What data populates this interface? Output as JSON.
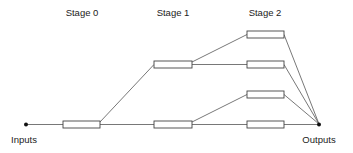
{
  "diagram": {
    "type": "staged-tree-network",
    "stages": [
      {
        "label": "Stage 0",
        "label_x": 82
      },
      {
        "label": "Stage 1",
        "label_x": 173
      },
      {
        "label": "Stage 2",
        "label_x": 265
      }
    ],
    "terminals": {
      "inputs": {
        "label": "Inputs",
        "x": 26,
        "y": 124
      },
      "outputs": {
        "label": "Outputs",
        "x": 319,
        "y": 124
      }
    },
    "colors": {
      "line": "#555555",
      "box_stroke": "#444444",
      "text": "#222222",
      "background": "#ffffff"
    }
  }
}
